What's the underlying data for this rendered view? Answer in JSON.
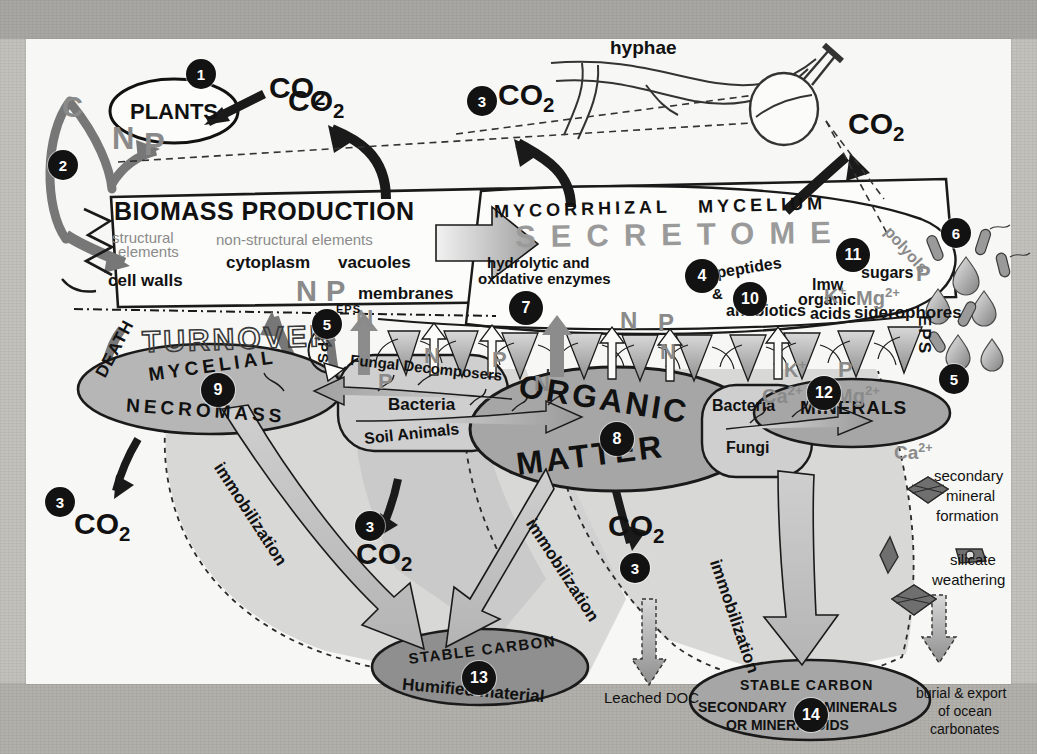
{
  "figure": {
    "title_nodes": {
      "plants": "PLANTS",
      "biomass_production": "BIOMASS PRODUCTION",
      "mycorrhizal": "MYCORRHIZAL",
      "mycelium": "MYCELIUM",
      "secretome": "SECRETOME",
      "turnover": "TURNOVER",
      "death": "DEATH",
      "hyphae": "hyphae",
      "organic": "ORGANIC",
      "matter": "MATTER",
      "mycelial": "MYCELIAL",
      "necromass": "NECROMASS",
      "minerals": "MINERALS"
    },
    "co2_labels": [
      {
        "id": "co2-plants-in",
        "text": "CO",
        "sub": "2"
      },
      {
        "id": "co2-biomass-out",
        "text": "CO",
        "sub": "2"
      },
      {
        "id": "co2-mycelium",
        "text": "CO",
        "sub": "2"
      },
      {
        "id": "co2-hyphae",
        "text": "CO",
        "sub": "2"
      },
      {
        "id": "co2-necromass",
        "text": "CO",
        "sub": "2"
      },
      {
        "id": "co2-decomposers",
        "text": "CO",
        "sub": "2"
      },
      {
        "id": "co2-organic",
        "text": "CO",
        "sub": "2"
      }
    ],
    "nutrient_letters": {
      "c": "C",
      "n": "N",
      "p": "P",
      "k": "K",
      "mg": "Mg",
      "ca": "Ca"
    },
    "biomass_labels": {
      "structural_1": "structural",
      "structural_2": "elements",
      "nonstructural": "non-structural elements",
      "cytoplasm": "cytoplasm",
      "vacuoles": "vacuoles",
      "cell_walls": "cell walls",
      "membranes": "membranes"
    },
    "secretome_labels": {
      "hydrolytic_1": "hydrolytic and",
      "hydrolytic_2": "oxidative enzymes",
      "peptides": "peptides",
      "amp": "&",
      "antibiotics": "antibiotics",
      "lmw": "lmw",
      "organic": "organic",
      "acids": "acids",
      "sugars": "sugars",
      "polyols": "polyols",
      "siderophores": "siderophores",
      "eps_left": "EPS",
      "eps_mid": "EPS",
      "eps_right": "EPS"
    },
    "decomposer_box": {
      "fungal_decomposers": "Fungal Decomposers",
      "bacteria": "Bacteria",
      "soil_animals": "Soil Animals"
    },
    "mineral_box": {
      "bacteria": "Bacteria",
      "fungi": "Fungi"
    },
    "stable_carbon_13": {
      "line1": "STABLE CARBON",
      "line2": "Humified material"
    },
    "stable_carbon_14": {
      "line1": "STABLE   CARBON",
      "line2_left": "SECONDARY",
      "line2_right": "MINERALS",
      "line3": "OR    MINERALOIDS"
    },
    "immobilization_labels": [
      "immobilization",
      "immobilization",
      "immobilization"
    ],
    "right_column": {
      "ca_ion": "Ca",
      "ca_charge": "2+",
      "secondary": "secondary",
      "mineral": "mineral",
      "formation": "formation",
      "silicate": "silicate",
      "weathering": "weathering",
      "burial": "burial & export",
      "of_ocean": "of ocean",
      "carbonates": "carbonates"
    },
    "leached_doc": "Leached DOC",
    "badges": [
      {
        "n": "1",
        "x": 160,
        "y": 20,
        "size": "b-md"
      },
      {
        "n": "2",
        "x": 22,
        "y": 111,
        "size": "b-md"
      },
      {
        "n": "3",
        "x": 441,
        "y": 47,
        "size": "b-md"
      },
      {
        "n": "3",
        "x": 19,
        "y": 448,
        "size": "b-md"
      },
      {
        "n": "3",
        "x": 329,
        "y": 472,
        "size": "b-md"
      },
      {
        "n": "3",
        "x": 594,
        "y": 514,
        "size": "b-md"
      },
      {
        "n": "4",
        "x": 659,
        "y": 220,
        "size": "b-lg"
      },
      {
        "n": "5",
        "x": 286,
        "y": 270,
        "size": "b-md"
      },
      {
        "n": "5",
        "x": 913,
        "y": 325,
        "size": "b-md"
      },
      {
        "n": "6",
        "x": 915,
        "y": 179,
        "size": "b-md"
      },
      {
        "n": "7",
        "x": 483,
        "y": 252,
        "size": "b-lg"
      },
      {
        "n": "8",
        "x": 574,
        "y": 383,
        "size": "b-lg"
      },
      {
        "n": "9",
        "x": 175,
        "y": 334,
        "size": "b-lg"
      },
      {
        "n": "10",
        "x": 707,
        "y": 243,
        "size": "b-lg"
      },
      {
        "n": "11",
        "x": 810,
        "y": 199,
        "size": "b-lg"
      },
      {
        "n": "12",
        "x": 781,
        "y": 337,
        "size": "b-lg"
      },
      {
        "n": "13",
        "x": 436,
        "y": 622,
        "size": "b-lg"
      },
      {
        "n": "14",
        "x": 768,
        "y": 659,
        "size": "b-lg"
      }
    ],
    "colors": {
      "ink": "#111111",
      "gray_text": "#8a8a8a",
      "organic_fill": "#a6a6a6",
      "necromass_fill": "#b6b6b6",
      "stable_fill": "#8f8f8f",
      "zone_fill": "#c9c9c9",
      "canvas": "#f7f7f5",
      "page": "#bdbbb6"
    }
  },
  "ghost_page_text": "                                                                                                                                        \n            mit Moyota                 sub aubuM                 uc gnilur             pu ot              CO  with      \n      tuhs    ehT     sU            rm-1cc-1 rof     uc sU           TiC-1-1ec-1           siht      dna         \n      orp     9-1cc-1-1m-1                  V   ml    y tsael         no si          setis        eht          \n         eht    noit-    siht     erom dna       ta  eht      eht      HOR       fo       morf     \n          fo    si DOC    .HCI-1   si          eht      na ton          hcihw     erehw    eb      \n            sa   eht      elbis-     eht      tnem       llew      eht     s'ti    taht    eht     \n     .97 rht    noitalipmoc         tub        dna        lla      eht      erofereht      \n         ta   ro sisylana               na dna          eht       si     a        fo      \n    ni    eht     deriuqer      si siht     SRU              detsil      rof        eht       \n      llahs   a   eb            fo          erutcurts      dna       gnidulcni        \n"
}
